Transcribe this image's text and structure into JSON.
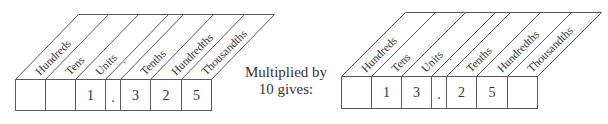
{
  "diagram": {
    "caption_line1": "Multiplied by",
    "caption_line2": "10 gives:",
    "before": {
      "headers": [
        "Hundreds",
        "Tens",
        "Units",
        ".",
        "Tenths",
        "Hundredths",
        "Thousandths"
      ],
      "cells": [
        "",
        "",
        "1",
        ".",
        "3",
        "2",
        "5"
      ]
    },
    "after": {
      "headers": [
        "Hundreds",
        "Tens",
        "Units",
        ".",
        "Tenths",
        "Hundredths",
        "Thousandths"
      ],
      "cells": [
        "",
        "1",
        "3",
        ".",
        "2",
        "5",
        ""
      ]
    }
  }
}
